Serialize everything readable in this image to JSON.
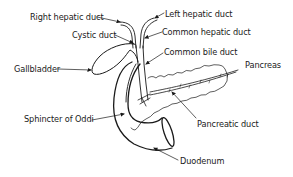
{
  "diagram": {
    "type": "anatomical-illustration",
    "colors": {
      "line": "#1a1a1a",
      "background": "#ffffff",
      "text": "#1a1a1a"
    },
    "labels": [
      {
        "id": "right-hepatic-duct",
        "text": "Right hepatic duct"
      },
      {
        "id": "left-hepatic-duct",
        "text": "Left hepatic duct"
      },
      {
        "id": "cystic-duct",
        "text": "Cystic duct"
      },
      {
        "id": "common-hepatic-duct",
        "text": "Common hepatic duct"
      },
      {
        "id": "common-bile-duct",
        "text": "Common bile duct"
      },
      {
        "id": "gallbladder",
        "text": "Gallbladder"
      },
      {
        "id": "pancreas",
        "text": "Pancreas"
      },
      {
        "id": "sphincter-of-oddi",
        "text": "Sphincter of Oddi"
      },
      {
        "id": "pancreatic-duct",
        "text": "Pancreatic duct"
      },
      {
        "id": "duodenum",
        "text": "Duodenum"
      }
    ]
  }
}
